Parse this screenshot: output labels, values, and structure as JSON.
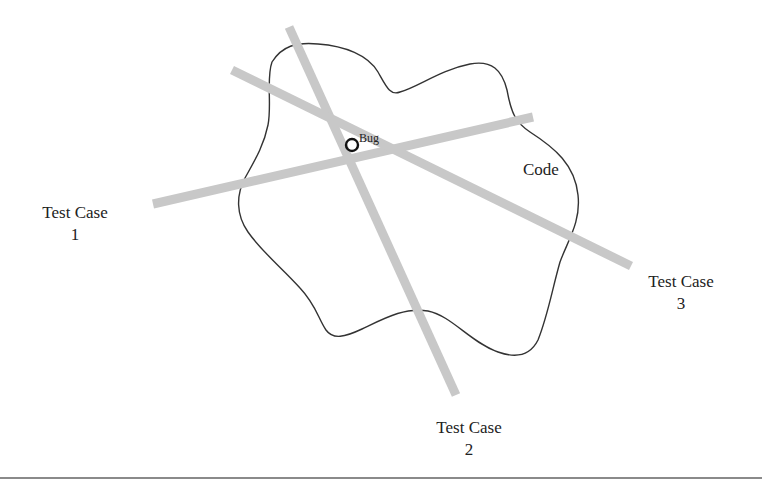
{
  "diagram": {
    "code_region": {
      "label": "Code",
      "outline_color": "#333333"
    },
    "bug": {
      "label": "Bug",
      "marker": "circle-marker",
      "marker_color": "#111111"
    },
    "test_cases": [
      {
        "title": "Test Case",
        "number": "1",
        "line_color": "#c8c8c8",
        "line": {
          "x1": 153,
          "y1": 204,
          "x2": 533,
          "y2": 117
        }
      },
      {
        "title": "Test Case",
        "number": "2",
        "line_color": "#c8c8c8",
        "line": {
          "x1": 289,
          "y1": 27,
          "x2": 456,
          "y2": 395
        }
      },
      {
        "title": "Test Case",
        "number": "3",
        "line_color": "#c8c8c8",
        "line": {
          "x1": 232,
          "y1": 70,
          "x2": 631,
          "y2": 266
        }
      }
    ],
    "separator_color": "#8a8a8a"
  }
}
